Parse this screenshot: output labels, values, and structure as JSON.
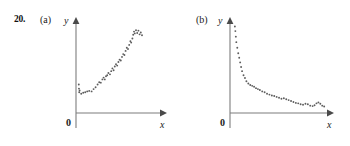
{
  "figure": {
    "problem_number": "20.",
    "background_color": "#ffffff",
    "axis_color": "#7d7d7d",
    "point_color": "#5d5d5d",
    "origin_label": "0",
    "x_axis_label": "x",
    "y_axis_label": "y"
  },
  "panels": [
    {
      "key": "a",
      "label": "(a)",
      "origin_label": "0",
      "x_axis_label": "x",
      "y_axis_label": "y"
    },
    {
      "key": "b",
      "label": "(b)",
      "origin_label": "0",
      "x_axis_label": "x",
      "y_axis_label": "y"
    }
  ],
  "chart_data": [
    {
      "type": "scatter",
      "title": "(a)",
      "xlabel": "x",
      "ylabel": "y",
      "grid": false,
      "legend": false,
      "xlim": [
        0,
        100
      ],
      "ylim": [
        0,
        100
      ],
      "description": "increasing exponential-like scatter rising from near the y-axis toward the upper right",
      "points": [
        [
          1.0,
          31.0
        ],
        [
          1.2,
          26.5
        ],
        [
          1.5,
          22.5
        ],
        [
          2.0,
          24.5
        ],
        [
          4.0,
          21.0
        ],
        [
          6.5,
          22.0
        ],
        [
          9.0,
          22.5
        ],
        [
          11.5,
          23.5
        ],
        [
          14.0,
          24.0
        ],
        [
          17.0,
          23.5
        ],
        [
          19.5,
          26.0
        ],
        [
          22.0,
          28.0
        ],
        [
          24.5,
          31.0
        ],
        [
          26.5,
          33.5
        ],
        [
          28.5,
          33.0
        ],
        [
          30.5,
          36.5
        ],
        [
          32.0,
          38.5
        ],
        [
          33.5,
          36.5
        ],
        [
          35.0,
          40.0
        ],
        [
          36.5,
          41.0
        ],
        [
          38.0,
          43.5
        ],
        [
          40.0,
          42.0
        ],
        [
          41.5,
          45.5
        ],
        [
          43.0,
          48.5
        ],
        [
          44.5,
          46.5
        ],
        [
          46.0,
          50.5
        ],
        [
          47.5,
          53.0
        ],
        [
          49.0,
          51.5
        ],
        [
          50.5,
          55.5
        ],
        [
          52.0,
          58.0
        ],
        [
          53.5,
          57.0
        ],
        [
          55.0,
          61.0
        ],
        [
          56.5,
          64.0
        ],
        [
          58.0,
          63.0
        ],
        [
          59.5,
          67.5
        ],
        [
          61.0,
          71.0
        ],
        [
          62.5,
          69.5
        ],
        [
          64.0,
          74.0
        ],
        [
          65.5,
          78.0
        ],
        [
          66.5,
          76.5
        ],
        [
          68.0,
          81.0
        ],
        [
          69.0,
          85.0
        ],
        [
          70.0,
          88.5
        ],
        [
          71.0,
          86.5
        ],
        [
          72.5,
          90.0
        ],
        [
          74.0,
          87.0
        ],
        [
          75.5,
          89.5
        ],
        [
          77.0,
          85.5
        ],
        [
          78.5,
          87.5
        ],
        [
          80.0,
          84.5
        ]
      ]
    },
    {
      "type": "scatter",
      "title": "(b)",
      "xlabel": "x",
      "ylabel": "y",
      "grid": false,
      "legend": false,
      "xlim": [
        0,
        100
      ],
      "ylim": [
        0,
        100
      ],
      "description": "decaying exponential-like scatter falling steeply from near the y-axis then flattening along the x-axis",
      "points": [
        [
          3.0,
          94.0
        ],
        [
          3.5,
          89.0
        ],
        [
          4.0,
          83.0
        ],
        [
          4.5,
          77.0
        ],
        [
          5.5,
          71.0
        ],
        [
          6.5,
          65.0
        ],
        [
          7.5,
          60.0
        ],
        [
          8.5,
          55.0
        ],
        [
          9.5,
          50.0
        ],
        [
          10.5,
          45.5
        ],
        [
          12.0,
          41.0
        ],
        [
          13.5,
          38.0
        ],
        [
          15.0,
          34.5
        ],
        [
          17.0,
          32.0
        ],
        [
          19.0,
          30.5
        ],
        [
          21.0,
          29.5
        ],
        [
          23.0,
          28.5
        ],
        [
          25.0,
          27.0
        ],
        [
          27.0,
          26.0
        ],
        [
          29.0,
          25.0
        ],
        [
          31.5,
          23.5
        ],
        [
          34.0,
          22.5
        ],
        [
          36.5,
          21.0
        ],
        [
          39.0,
          20.0
        ],
        [
          41.5,
          19.0
        ],
        [
          44.0,
          18.5
        ],
        [
          46.5,
          17.5
        ],
        [
          49.0,
          16.5
        ],
        [
          51.5,
          15.5
        ],
        [
          54.0,
          16.0
        ],
        [
          56.5,
          15.0
        ],
        [
          59.0,
          14.0
        ],
        [
          61.5,
          13.0
        ],
        [
          64.0,
          12.0
        ],
        [
          66.5,
          11.0
        ],
        [
          69.0,
          10.5
        ],
        [
          71.5,
          9.5
        ],
        [
          74.0,
          9.0
        ],
        [
          76.5,
          10.0
        ],
        [
          79.0,
          9.5
        ],
        [
          81.5,
          8.0
        ],
        [
          84.0,
          7.5
        ],
        [
          86.0,
          8.5
        ],
        [
          88.0,
          10.5
        ],
        [
          90.0,
          11.5
        ],
        [
          92.0,
          10.0
        ],
        [
          94.0,
          8.0
        ],
        [
          96.0,
          7.0
        ]
      ]
    }
  ]
}
